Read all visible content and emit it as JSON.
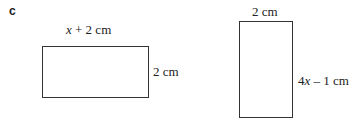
{
  "part_label": "c",
  "rectangle_1": {
    "top_label_var": "x",
    "top_label_rest": " + 2 cm",
    "side_label": "2 cm"
  },
  "rectangle_2": {
    "top_label": "2 cm",
    "side_label_coef": "4",
    "side_label_var": "x",
    "side_label_rest": " – 1 cm"
  }
}
